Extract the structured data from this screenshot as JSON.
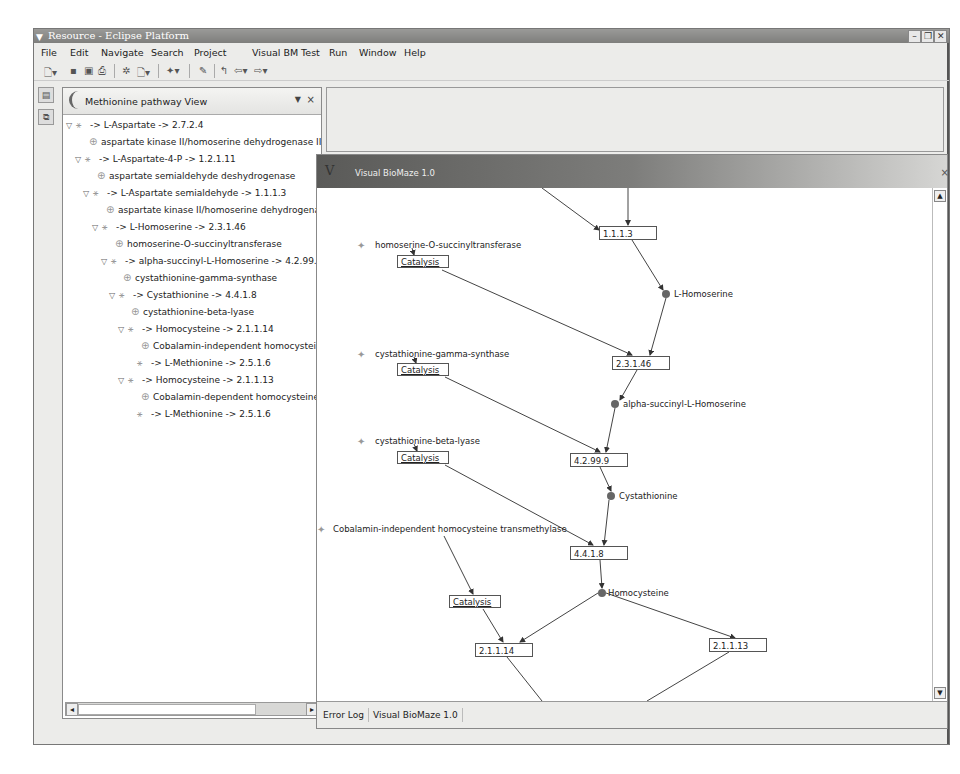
{
  "window": {
    "title": "Resource - Eclipse Platform",
    "controls": [
      "minimize",
      "maximize",
      "close"
    ]
  },
  "menubar": {
    "items": [
      {
        "label": "File",
        "mnemonic": "F"
      },
      {
        "label": "Edit",
        "mnemonic": "E"
      },
      {
        "label": "Navigate",
        "mnemonic": "N"
      },
      {
        "label": "Search",
        "mnemonic": "a"
      },
      {
        "label": "Project",
        "mnemonic": "P"
      },
      {
        "label": "Visual BM Test",
        "mnemonic": ""
      },
      {
        "label": "Run",
        "mnemonic": "R"
      },
      {
        "label": "Window",
        "mnemonic": "W"
      },
      {
        "label": "Help",
        "mnemonic": "H"
      }
    ]
  },
  "toolbar": {
    "icons": [
      "new-wizard-icon",
      "save-icon",
      "save-all-icon",
      "print-icon",
      "debug-icon",
      "new-dropdown-icon",
      "search-icon",
      "edit-icon",
      "prev-annotation-icon",
      "back-icon",
      "forward-icon"
    ]
  },
  "pathway_view": {
    "title": "Methionine pathway View",
    "menu_glyph": "▼",
    "close_glyph": "×",
    "tree": [
      {
        "type": "reaction",
        "indent": 0,
        "expanded": true,
        "label": "-> L-Aspartate -> 2.7.2.4"
      },
      {
        "type": "enzyme",
        "indent": 1,
        "label": "aspartate kinase II/homoserine dehydrogenase II"
      },
      {
        "type": "reaction",
        "indent": 1,
        "expanded": true,
        "label": "-> L-Aspartate-4-P -> 1.2.1.11"
      },
      {
        "type": "enzyme",
        "indent": 2,
        "label": "aspartate semialdehyde deshydrogenase"
      },
      {
        "type": "reaction",
        "indent": 2,
        "expanded": true,
        "label": "-> L-Aspartate semialdehyde -> 1.1.1.3"
      },
      {
        "type": "enzyme",
        "indent": 3,
        "label": "aspartate kinase II/homoserine dehydrogenase"
      },
      {
        "type": "reaction",
        "indent": 3,
        "expanded": true,
        "label": "-> L-Homoserine -> 2.3.1.46"
      },
      {
        "type": "enzyme",
        "indent": 4,
        "label": "homoserine-O-succinyltransferase"
      },
      {
        "type": "reaction",
        "indent": 4,
        "expanded": true,
        "label": "-> alpha-succinyl-L-Homoserine -> 4.2.99.9"
      },
      {
        "type": "enzyme",
        "indent": 5,
        "label": "cystathionine-gamma-synthase"
      },
      {
        "type": "reaction",
        "indent": 5,
        "expanded": true,
        "label": "-> Cystathionine -> 4.4.1.8"
      },
      {
        "type": "enzyme",
        "indent": 6,
        "label": "cystathionine-beta-lyase"
      },
      {
        "type": "reaction",
        "indent": 6,
        "expanded": true,
        "label": "-> Homocysteine -> 2.1.1.14"
      },
      {
        "type": "enzyme",
        "indent": 7,
        "label": "Cobalamin-independent homocysteine"
      },
      {
        "type": "reaction",
        "indent": 7,
        "expanded": false,
        "leaf": true,
        "label": "-> L-Methionine -> 2.5.1.6"
      },
      {
        "type": "reaction",
        "indent": 6,
        "expanded": true,
        "label": "-> Homocysteine -> 2.1.1.13"
      },
      {
        "type": "enzyme",
        "indent": 7,
        "label": "Cobalamin-dependent homocysteine t"
      },
      {
        "type": "reaction",
        "indent": 7,
        "expanded": false,
        "leaf": true,
        "label": "-> L-Methionine -> 2.5.1.6"
      }
    ]
  },
  "biomaze_view": {
    "title": "Visual BioMaze 1.0",
    "logo": "V",
    "close_glyph": "×",
    "graph": {
      "reactions": [
        {
          "id": "1.1.1.3",
          "x": 282,
          "y": 38,
          "w": 58
        },
        {
          "id": "2.3.1.46",
          "x": 295,
          "y": 168,
          "w": 58
        },
        {
          "id": "4.2.99.9",
          "x": 253,
          "y": 265,
          "w": 58
        },
        {
          "id": "4.4.1.8",
          "x": 253,
          "y": 358,
          "w": 58
        },
        {
          "id": "2.1.1.14",
          "x": 158,
          "y": 455,
          "w": 58
        },
        {
          "id": "2.1.1.13",
          "x": 392,
          "y": 450,
          "w": 58
        }
      ],
      "metabolites": [
        {
          "name": "L-Homoserine",
          "x": 348,
          "y": 102
        },
        {
          "name": "alpha-succinyl-L-Homoserine",
          "x": 295,
          "y": 212
        },
        {
          "name": "Cystathionine",
          "x": 293,
          "y": 304
        },
        {
          "name": "Homocysteine",
          "x": 283,
          "y": 401
        }
      ],
      "enzymes": [
        {
          "name": "homoserine-O-succinyltransferase",
          "x": 40,
          "y": 55
        },
        {
          "name": "cystathionine-gamma-synthase",
          "x": 40,
          "y": 164
        },
        {
          "name": "cystathionine-beta-lyase",
          "x": 40,
          "y": 251
        },
        {
          "name": "Cobalamin-independent homocysteine transmethylase",
          "x": 0,
          "y": 339
        }
      ],
      "catalysis": [
        {
          "label": "Catalysis",
          "x": 80,
          "y": 67
        },
        {
          "label": "Catalysis",
          "x": 80,
          "y": 175
        },
        {
          "label": "Catalysis",
          "x": 80,
          "y": 263
        },
        {
          "label": "Catalysis",
          "x": 132,
          "y": 407
        }
      ]
    }
  },
  "bottom_tabs": [
    {
      "label": "Error Log",
      "active": false
    },
    {
      "label": "Visual BioMaze 1.0",
      "active": true
    }
  ],
  "colors": {
    "titlebar": "#8a8a88",
    "panel_bg": "#ececea",
    "node_border": "#555555",
    "metabolite": "#666666"
  }
}
